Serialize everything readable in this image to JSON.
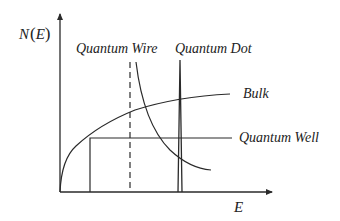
{
  "diagram": {
    "axes": {
      "y_label": "N(E)",
      "y_label_parts": {
        "func": "N",
        "open": "(",
        "var": "E",
        "close": ")"
      },
      "x_label": "E"
    },
    "labels": {
      "quantum_wire": "Quantum Wire",
      "quantum_dot": "Quantum Dot",
      "bulk": "Bulk",
      "quantum_well": "Quantum Well"
    },
    "colors": {
      "line": "#2a2a2a",
      "background": "#ffffff",
      "text": "#222222"
    }
  }
}
